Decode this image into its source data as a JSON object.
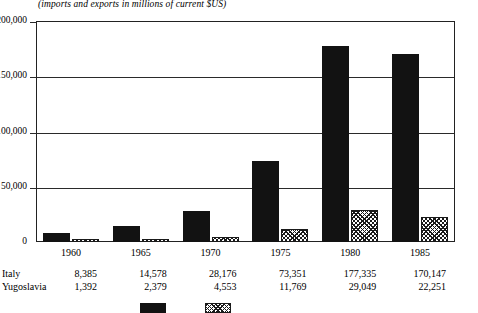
{
  "chart_data": {
    "type": "bar",
    "title": "",
    "subtitle": "(imports and exports in millions of current $US)",
    "xlabel": "",
    "ylabel": "",
    "categories": [
      "1960",
      "1965",
      "1970",
      "1975",
      "1980",
      "1985"
    ],
    "series": [
      {
        "name": "Italy",
        "values": [
          8385,
          14578,
          28176,
          73351,
          177335,
          170147
        ],
        "pattern": "solid-black"
      },
      {
        "name": "Yugoslavia",
        "values": [
          1392,
          2379,
          4553,
          11769,
          29049,
          22251
        ],
        "pattern": "diagonal-hatch"
      }
    ],
    "ylim": [
      0,
      200000
    ],
    "yticks": [
      0,
      50000,
      100000,
      150000,
      200000
    ],
    "ytick_labels": [
      "0",
      "50,000",
      "100,000",
      "150,000",
      "200,000"
    ],
    "grid": true,
    "legend_position": "bottom",
    "value_table": {
      "row_labels": [
        "Italy",
        "Yugoslavia"
      ],
      "rows": [
        [
          "8,385",
          "14,578",
          "28,176",
          "73,351",
          "177,335",
          "170,147"
        ],
        [
          "1,392",
          "2,379",
          "4,553",
          "11,769",
          "29,049",
          "22,251"
        ]
      ]
    }
  },
  "colors": {
    "italy_bar": "#121212",
    "yugoslavia_bar": "#ffffff",
    "axis": "#222222",
    "text": "#000000",
    "background": "#ffffff"
  }
}
